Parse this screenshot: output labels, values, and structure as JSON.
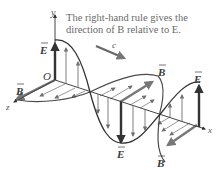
{
  "caption": {
    "line1": "The right-hand rule gives the",
    "line2": "direction of B relative to E."
  },
  "labels": {
    "y_axis": "y",
    "x_axis": "x",
    "z_axis": "z",
    "origin": "O",
    "speed": "c",
    "E": "E",
    "B": "B"
  },
  "colors": {
    "wave_curve": "#4a4a4a",
    "field_arrow": "#707070",
    "bold_arrow": "#333333",
    "axis": "#444444",
    "caption_text": "#6a6a6a",
    "c_arrow": "#6a6a6a"
  }
}
